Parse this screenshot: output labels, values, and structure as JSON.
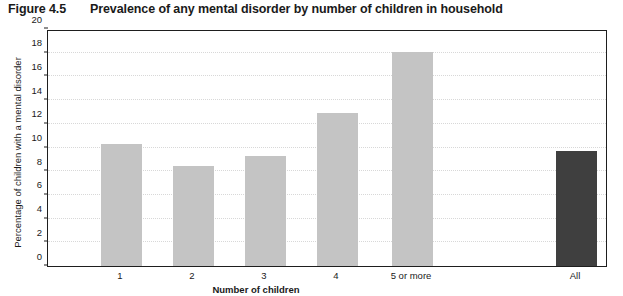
{
  "figure": {
    "number": "Figure 4.5",
    "title": "Prevalence of any mental disorder by number of children in household"
  },
  "chart_data": {
    "type": "bar",
    "title": "Prevalence of any mental disorder by number of children in household",
    "xlabel": "Number of children",
    "ylabel": "Percentage of children with a mental disorder",
    "categories": [
      "1",
      "2",
      "3",
      "4",
      "5 or more",
      "All"
    ],
    "values": [
      10.3,
      8.4,
      9.3,
      12.9,
      18.1,
      9.7
    ],
    "ylim": [
      0,
      20
    ],
    "yticks": [
      0,
      2,
      4,
      6,
      8,
      10,
      12,
      14,
      16,
      18,
      20
    ],
    "ytick_labels": [
      "0",
      "2",
      "4",
      "6",
      "8",
      "10",
      "12",
      "14",
      "16",
      "18",
      "20"
    ],
    "grid": true,
    "legend": null,
    "series": [
      {
        "name": "Percentage of children with a mental disorder",
        "values": [
          10.3,
          8.4,
          9.3,
          12.9,
          18.1,
          9.7
        ]
      }
    ],
    "bar_colors": [
      "#c4c4c4",
      "#c4c4c4",
      "#c4c4c4",
      "#c4c4c4",
      "#c4c4c4",
      "#3f3f3f"
    ],
    "colors": {
      "bar_light": "#c4c4c4",
      "bar_dark": "#3f3f3f",
      "axis": "#1e1e1e",
      "gridline": "#d8d8d8",
      "background": "#ffffff"
    }
  }
}
